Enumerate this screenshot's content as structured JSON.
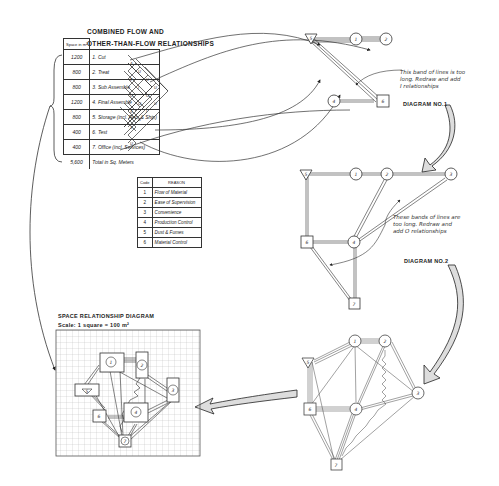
{
  "matrix": {
    "title_line1": "COMBINED FLOW AND",
    "title_line2": "OTHER-THAN-FLOW RELATIONSHIPS",
    "space_header": "Space in m²",
    "activities": [
      {
        "space": "1200",
        "label": "1. Cut"
      },
      {
        "space": "800",
        "label": "2. Treat"
      },
      {
        "space": "800",
        "label": "3. Sub Assemble"
      },
      {
        "space": "1200",
        "label": "4. Final Assemble"
      },
      {
        "space": "800",
        "label": "5. Storage (incl. Rec. & Ship)"
      },
      {
        "space": "400",
        "label": "6. Test"
      },
      {
        "space": "400",
        "label": "7. Office (incl. Services)"
      }
    ],
    "total": {
      "space": "5,600",
      "label": "Total in Sq. Meters"
    }
  },
  "reason_table": {
    "header_code": "Code",
    "header_reason": "REASON",
    "rows": [
      {
        "code": "1",
        "reason": "Flow of Material"
      },
      {
        "code": "2",
        "reason": "Ease of Supervision"
      },
      {
        "code": "3",
        "reason": "Convenience"
      },
      {
        "code": "4",
        "reason": "Production Control"
      },
      {
        "code": "5",
        "reason": "Dust & Fumes"
      },
      {
        "code": "6",
        "reason": "Material Control"
      }
    ]
  },
  "diagram1": {
    "label": "DIAGRAM NO.1",
    "note": [
      "This band of lines is too",
      "long. Redraw and add",
      "I relationships"
    ],
    "nodes": [
      "5",
      "1",
      "2",
      "4",
      "6"
    ]
  },
  "diagram2": {
    "label": "DIAGRAM NO.2",
    "note": [
      "These bands of lines are",
      "too long. Redraw and",
      "add O relationships"
    ],
    "nodes": [
      "5",
      "1",
      "2",
      "3",
      "6",
      "4",
      "7"
    ]
  },
  "diagram3": {
    "nodes": [
      "5",
      "1",
      "2",
      "3",
      "6",
      "4",
      "7"
    ]
  },
  "space_diagram": {
    "title": "SPACE RELATIONSHIP DIAGRAM",
    "scale": "Scale: 1 square = 100 m²",
    "nodes": [
      "1",
      "2",
      "3",
      "4",
      "5",
      "6",
      "7"
    ]
  }
}
